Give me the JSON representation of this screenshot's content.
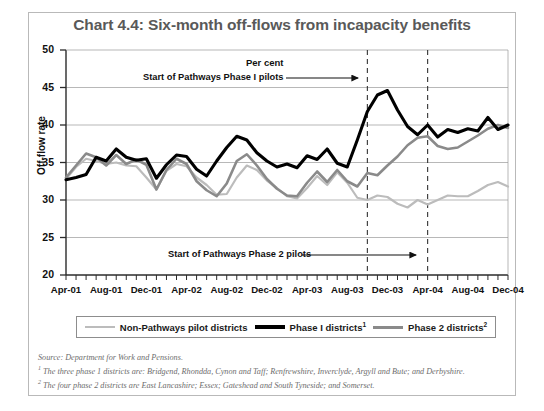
{
  "figure": {
    "title": "Chart 4.4: Six-month off-flows from incapacity benefits",
    "unit_label": "Per cent"
  },
  "annotations": {
    "phase1": "Start of Pathways Phase I pilots",
    "phase2": "Start of Pathways Phase 2 pilots"
  },
  "legend": {
    "items": [
      {
        "label": "Non-Pathways pilot districts",
        "sup": "",
        "color": "#bcbcbc",
        "style": "light"
      },
      {
        "label": "Phase I districts",
        "sup": "1",
        "color": "#000000",
        "style": "black"
      },
      {
        "label": "Phase 2 districts",
        "sup": "2",
        "color": "#8a8a8a",
        "style": "mid"
      }
    ]
  },
  "notes": {
    "source": "Source: Department for Work and Pensions.",
    "note1_marker": "1",
    "note1": " The three phase 1 districts are: Bridgend, Rhondda, Cynon and Taff; Renfrewshire, Inverclyde, Argyll and Bute; and Derbyshire.",
    "note2_marker": "2",
    "note2": " The four phase 2 districts are East Lancashire; Essex; Gateshead and South Tyneside; and Somerset."
  },
  "chart_data": {
    "type": "line",
    "title": "Chart 4.4: Six-month off-flows from incapacity benefits",
    "xlabel": "",
    "ylabel": "Off-flow rate",
    "unit": "Per cent",
    "ylim": [
      20,
      50
    ],
    "yticks": [
      20,
      25,
      30,
      35,
      40,
      45,
      50
    ],
    "grid": true,
    "legend_position": "below",
    "x_tick_labels": [
      "Apr-01",
      "Aug-01",
      "Dec-01",
      "Apr-02",
      "Aug-02",
      "Dec-02",
      "Apr-03",
      "Aug-03",
      "Dec-03",
      "Apr-04",
      "Aug-04",
      "Dec-04"
    ],
    "x": [
      "Apr-01",
      "May-01",
      "Jun-01",
      "Jul-01",
      "Aug-01",
      "Sep-01",
      "Oct-01",
      "Nov-01",
      "Dec-01",
      "Jan-02",
      "Feb-02",
      "Mar-02",
      "Apr-02",
      "May-02",
      "Jun-02",
      "Jul-02",
      "Aug-02",
      "Sep-02",
      "Oct-02",
      "Nov-02",
      "Dec-02",
      "Jan-03",
      "Feb-03",
      "Mar-03",
      "Apr-03",
      "May-03",
      "Jun-03",
      "Jul-03",
      "Aug-03",
      "Sep-03",
      "Oct-03",
      "Nov-03",
      "Dec-03",
      "Jan-04",
      "Feb-04",
      "Mar-04",
      "Apr-04",
      "May-04",
      "Jun-04",
      "Jul-04",
      "Aug-04",
      "Sep-04",
      "Oct-04",
      "Nov-04",
      "Dec-04"
    ],
    "series": [
      {
        "name": "Non-Pathways pilot districts",
        "color": "#bcbcbc",
        "values": [
          32.8,
          34.4,
          35.5,
          35.2,
          34.8,
          35.0,
          34.6,
          34.5,
          33.0,
          31.4,
          33.9,
          34.8,
          34.5,
          33.0,
          32.0,
          30.7,
          30.8,
          33.0,
          34.6,
          34.0,
          32.6,
          31.6,
          30.5,
          30.2,
          31.6,
          33.2,
          32.0,
          33.7,
          32.3,
          30.3,
          30.0,
          30.6,
          30.4,
          29.5,
          29.0,
          30.0,
          29.4,
          30.0,
          30.6,
          30.5,
          30.5,
          31.2,
          32.0,
          32.4,
          31.8
        ]
      },
      {
        "name": "Phase I districts",
        "color": "#000000",
        "values": [
          32.7,
          33.0,
          33.4,
          35.7,
          35.2,
          36.8,
          35.7,
          35.3,
          35.5,
          32.9,
          34.7,
          36.0,
          35.8,
          34.1,
          33.2,
          35.2,
          37.0,
          38.5,
          38.0,
          36.3,
          35.2,
          34.4,
          34.8,
          34.3,
          35.9,
          35.4,
          36.8,
          34.9,
          34.4,
          38.0,
          41.8,
          44.0,
          44.6,
          42.0,
          39.8,
          38.7,
          40.0,
          38.4,
          39.4,
          39.0,
          39.5,
          39.2,
          41.0,
          39.4,
          40.0
        ]
      },
      {
        "name": "Phase 2 districts",
        "color": "#8a8a8a",
        "values": [
          33.0,
          34.6,
          36.2,
          35.7,
          34.6,
          36.0,
          34.8,
          35.4,
          34.7,
          31.4,
          34.0,
          35.5,
          34.8,
          32.5,
          31.3,
          30.5,
          32.2,
          35.2,
          36.1,
          34.6,
          32.8,
          31.5,
          30.6,
          30.5,
          32.3,
          33.8,
          32.4,
          34.0,
          32.5,
          31.8,
          33.6,
          33.3,
          34.6,
          35.8,
          37.3,
          38.3,
          38.5,
          37.2,
          36.8,
          37.0,
          37.8,
          38.6,
          39.5,
          40.0,
          39.6
        ]
      }
    ],
    "vertical_markers": [
      {
        "label": "Start of Pathways Phase I pilots",
        "x": "Oct-03"
      },
      {
        "label": "Start of Pathways Phase 2 pilots",
        "x": "Apr-04"
      }
    ]
  }
}
